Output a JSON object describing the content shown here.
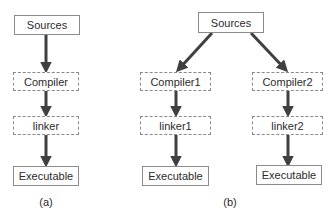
{
  "diagram_a": {
    "caption": "(a)",
    "nodes": {
      "sources": "Sources",
      "compiler": "Compiler",
      "linker": "linker",
      "executable": "Executable"
    }
  },
  "diagram_b": {
    "caption": "(b)",
    "nodes": {
      "sources": "Sources",
      "compiler1": "Compiler1",
      "compiler2": "Compiler2",
      "linker1": "linker1",
      "linker2": "linker2",
      "executable1": "Executable",
      "executable2": "Executable"
    }
  },
  "colors": {
    "arrow": "#404040",
    "border": "#8a8a8a",
    "text": "#2b2b2b"
  }
}
